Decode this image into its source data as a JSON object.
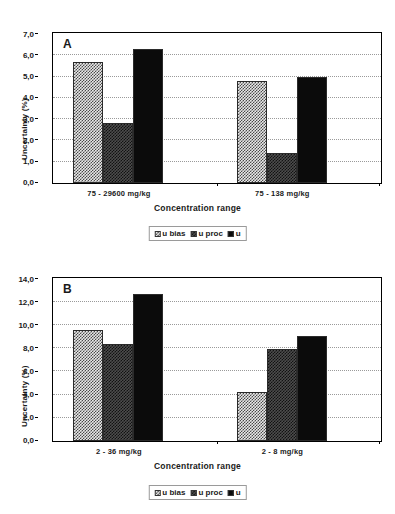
{
  "figure": {
    "ylabel": "Uncertainty (%)",
    "xlabel": "Concentration range",
    "legend": [
      {
        "key": "u_bias",
        "label": "u bias",
        "swatch": "light-checker-swatch"
      },
      {
        "key": "u_proc",
        "label": "u proc",
        "swatch": "dark-checker-swatch"
      },
      {
        "key": "u",
        "label": "u",
        "swatch": "solid-black-swatch"
      }
    ]
  },
  "chart_data": [
    {
      "type": "bar",
      "panel": "A",
      "title": "A",
      "xlabel": "Concentration range",
      "ylabel": "Uncertainty (%)",
      "categories": [
        "75 - 29600 mg/kg",
        "75 - 138 mg/kg"
      ],
      "series": [
        {
          "name": "u bias",
          "values": [
            5.7,
            4.8
          ]
        },
        {
          "name": "u proc",
          "values": [
            2.8,
            1.4
          ]
        },
        {
          "name": "u",
          "values": [
            6.3,
            5.0
          ]
        }
      ],
      "ylim": [
        0.0,
        7.0
      ],
      "yticks": [
        "0,0",
        "1,0",
        "2,0",
        "3,0",
        "4,0",
        "5,0",
        "6,0",
        "7,0"
      ],
      "ytick_values": [
        0.0,
        1.0,
        2.0,
        3.0,
        4.0,
        5.0,
        6.0,
        7.0
      ],
      "grid": true,
      "legend_position": "bottom-center"
    },
    {
      "type": "bar",
      "panel": "B",
      "title": "B",
      "xlabel": "Concentration range",
      "ylabel": "Uncertainty (%)",
      "categories": [
        "2 - 36 mg/kg",
        "2 - 8 mg/kg"
      ],
      "series": [
        {
          "name": "u bias",
          "values": [
            9.6,
            4.2
          ]
        },
        {
          "name": "u proc",
          "values": [
            8.4,
            8.0
          ]
        },
        {
          "name": "u",
          "values": [
            12.7,
            9.1
          ]
        }
      ],
      "ylim": [
        0.0,
        14.0
      ],
      "yticks": [
        "0,0",
        "2,0",
        "4,0",
        "6,0",
        "8,0",
        "10,0",
        "12,0",
        "14,0"
      ],
      "ytick_values": [
        0.0,
        2.0,
        4.0,
        6.0,
        8.0,
        10.0,
        12.0,
        14.0
      ],
      "grid": true,
      "legend_position": "bottom-center"
    }
  ]
}
